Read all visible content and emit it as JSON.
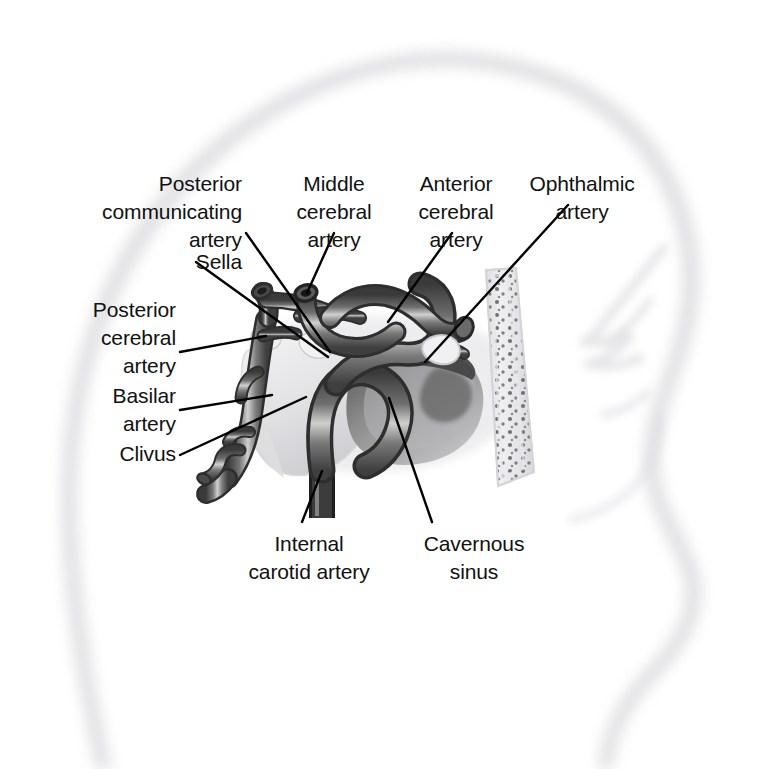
{
  "figure": {
    "background_color": "#ffffff",
    "silhouette_color": "#e9e9ec",
    "artery_dark": "#5a5a5a",
    "artery_outline": "#2f2f2f",
    "artery_highlight": "#d8d8d8",
    "bone_color": "#e3e3e6",
    "sinus_color": "#6e6e6e",
    "leader_line_color": "#000000"
  },
  "labels": [
    {
      "id": "posterior-communicating-artery",
      "text": "Posterior\ncommunicating\nartery",
      "align": "right",
      "x": 62,
      "y": 170,
      "width": 180
    },
    {
      "id": "middle-cerebral-artery",
      "text": "Middle\ncerebral\nartery",
      "align": "center",
      "x": 278,
      "y": 170,
      "width": 112
    },
    {
      "id": "anterior-cerebral-artery",
      "text": "Anterior\ncerebral\nartery",
      "align": "center",
      "x": 400,
      "y": 170,
      "width": 112
    },
    {
      "id": "ophthalmic-artery",
      "text": "Ophthalmic\nartery",
      "align": "center",
      "x": 518,
      "y": 170,
      "width": 128
    },
    {
      "id": "sella",
      "text": "Sella",
      "align": "right",
      "x": 102,
      "y": 248,
      "width": 140
    },
    {
      "id": "posterior-cerebral-artery",
      "text": "Posterior\ncerebral\nartery",
      "align": "right",
      "x": 28,
      "y": 296,
      "width": 148
    },
    {
      "id": "basilar-artery",
      "text": "Basilar\nartery",
      "align": "right",
      "x": 38,
      "y": 382,
      "width": 138
    },
    {
      "id": "clivus",
      "text": "Clivus",
      "align": "right",
      "x": 38,
      "y": 440,
      "width": 138
    },
    {
      "id": "internal-carotid-artery",
      "text": "Internal\ncarotid artery",
      "align": "center",
      "x": 212,
      "y": 530,
      "width": 194
    },
    {
      "id": "cavernous-sinus",
      "text": "Cavernous\nsinus",
      "align": "center",
      "x": 398,
      "y": 530,
      "width": 152
    }
  ],
  "leader_lines": [
    {
      "id": "leader-posterior-communicating-artery",
      "x1": 246,
      "y1": 233,
      "x2": 330,
      "y2": 352
    },
    {
      "id": "leader-middle-cerebral-artery",
      "x1": 334,
      "y1": 233,
      "x2": 307,
      "y2": 293
    },
    {
      "id": "leader-anterior-cerebral-artery",
      "x1": 452,
      "y1": 233,
      "x2": 388,
      "y2": 322
    },
    {
      "id": "leader-ophthalmic-artery",
      "x1": 568,
      "y1": 205,
      "x2": 425,
      "y2": 362
    },
    {
      "id": "leader-sella",
      "x1": 196,
      "y1": 262,
      "x2": 328,
      "y2": 357
    },
    {
      "id": "leader-posterior-cerebral-artery",
      "x1": 180,
      "y1": 352,
      "x2": 266,
      "y2": 336
    },
    {
      "id": "leader-basilar-artery",
      "x1": 180,
      "y1": 410,
      "x2": 272,
      "y2": 395
    },
    {
      "id": "leader-clivus",
      "x1": 180,
      "y1": 455,
      "x2": 306,
      "y2": 397
    },
    {
      "id": "leader-internal-carotid-artery",
      "x1": 302,
      "y1": 522,
      "x2": 322,
      "y2": 471
    },
    {
      "id": "leader-cavernous-sinus",
      "x1": 432,
      "y1": 522,
      "x2": 389,
      "y2": 398
    }
  ]
}
